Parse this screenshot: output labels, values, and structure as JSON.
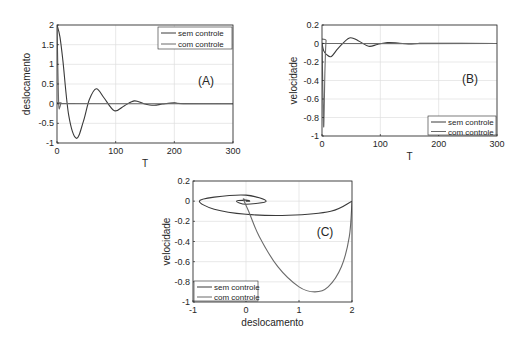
{
  "chart_data": [
    {
      "id": "A",
      "type": "line",
      "panel_label": "(A)",
      "xlabel": "T",
      "ylabel": "deslocamento",
      "xlim": [
        0,
        300
      ],
      "ylim": [
        -1,
        2
      ],
      "xticks": [
        0,
        100,
        200,
        300
      ],
      "yticks": [
        -1,
        -0.5,
        0,
        0.5,
        1,
        1.5,
        2
      ],
      "grid": true,
      "legend_position": "upper right",
      "series": [
        {
          "name": "sem controle",
          "color": "#3a3a3a",
          "x": [
            0,
            5,
            10,
            20,
            33,
            45,
            55,
            67,
            80,
            98,
            115,
            132,
            148,
            165,
            180,
            200,
            215,
            300
          ],
          "y": [
            2,
            1.7,
            1.1,
            -0.3,
            -0.88,
            -0.45,
            0.1,
            0.38,
            0.15,
            -0.18,
            -0.05,
            0.07,
            0.0,
            -0.04,
            -0.01,
            0.02,
            0.0,
            0.0
          ]
        },
        {
          "name": "com controle",
          "color": "#6a6a6a",
          "x": [
            0,
            1.5,
            3,
            5,
            7,
            10,
            300
          ],
          "y": [
            2,
            0.9,
            -0.05,
            -0.08,
            0.02,
            0.0,
            0.0
          ]
        }
      ]
    },
    {
      "id": "B",
      "type": "line",
      "panel_label": "(B)",
      "xlabel": "T",
      "ylabel": "velocidade",
      "xlim": [
        0,
        300
      ],
      "ylim": [
        -1,
        0.2
      ],
      "xticks": [
        0,
        100,
        200,
        300
      ],
      "yticks": [
        -1,
        -0.8,
        -0.6,
        -0.4,
        -0.2,
        0,
        0.2
      ],
      "grid": true,
      "legend_position": "lower right",
      "series": [
        {
          "name": "sem controle",
          "color": "#3a3a3a",
          "x": [
            0,
            3,
            8,
            16,
            28,
            47,
            62,
            80,
            95,
            112,
            130,
            148,
            165,
            180,
            300
          ],
          "y": [
            0,
            -0.08,
            -0.12,
            -0.14,
            -0.05,
            0.06,
            0.03,
            -0.03,
            -0.01,
            0.01,
            0.005,
            -0.005,
            0.0,
            0.002,
            0.0
          ]
        },
        {
          "name": "com controle",
          "color": "#6a6a6a",
          "x": [
            0,
            1.5,
            3,
            5,
            7,
            10,
            300
          ],
          "y": [
            0,
            -0.5,
            -0.9,
            -0.3,
            0.03,
            0.0,
            0.0
          ]
        }
      ]
    },
    {
      "id": "C",
      "type": "line",
      "panel_label": "(C)",
      "xlabel": "deslocamento",
      "ylabel": "velocidade",
      "xlim": [
        -1,
        2
      ],
      "ylim": [
        -1,
        0.2
      ],
      "xticks": [
        -1,
        0,
        1,
        2
      ],
      "yticks": [
        -1,
        -0.8,
        -0.6,
        -0.4,
        -0.2,
        0,
        0.2
      ],
      "grid": true,
      "legend_position": "lower left",
      "series": [
        {
          "name": "sem controle",
          "color": "#3a3a3a",
          "description": "spiral phase portrait from (2,0) decaying to origin",
          "x": [
            2,
            1.6,
            0.8,
            0.0,
            -0.6,
            -0.88,
            -0.6,
            0.0,
            0.38,
            0.0,
            -0.18,
            0.0,
            0.07,
            0.0
          ],
          "y": [
            0,
            -0.1,
            -0.14,
            -0.13,
            -0.08,
            0.0,
            0.04,
            0.06,
            0.0,
            -0.03,
            0.0,
            0.01,
            0.0,
            0.0
          ]
        },
        {
          "name": "com controle",
          "color": "#6a6a6a",
          "description": "direct path from (2,0) down to (1.3,-0.9) then back to origin",
          "x": [
            2,
            1.95,
            1.8,
            1.55,
            1.3,
            1.0,
            0.6,
            0.25,
            0.05,
            -0.05,
            0.0
          ],
          "y": [
            0,
            -0.35,
            -0.65,
            -0.85,
            -0.9,
            -0.85,
            -0.65,
            -0.35,
            -0.1,
            0.02,
            0.0
          ]
        }
      ]
    }
  ]
}
